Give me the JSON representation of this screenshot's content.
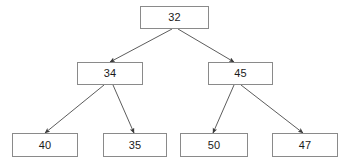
{
  "diagram": {
    "type": "binary-tree",
    "background_color": "#ffffff",
    "node_fill_color": "#ffffff",
    "node_border_color": "#8a8a8a",
    "edge_color": "#4a4a4a",
    "text_color": "#1a1a1a",
    "nodes": [
      {
        "id": "n32",
        "label": "32",
        "level": 0,
        "x": 140,
        "y": 6,
        "w": 69,
        "h": 23
      },
      {
        "id": "n34",
        "label": "34",
        "level": 1,
        "x": 77,
        "y": 62,
        "w": 66,
        "h": 23
      },
      {
        "id": "n45",
        "label": "45",
        "level": 1,
        "x": 208,
        "y": 62,
        "w": 65,
        "h": 23
      },
      {
        "id": "n40",
        "label": "40",
        "level": 2,
        "x": 12,
        "y": 133,
        "w": 66,
        "h": 24
      },
      {
        "id": "n35",
        "label": "35",
        "level": 2,
        "x": 103,
        "y": 133,
        "w": 64,
        "h": 24
      },
      {
        "id": "n50",
        "label": "50",
        "level": 2,
        "x": 180,
        "y": 133,
        "w": 68,
        "h": 24
      },
      {
        "id": "n47",
        "label": "47",
        "level": 2,
        "x": 272,
        "y": 133,
        "w": 66,
        "h": 24
      }
    ],
    "edges": [
      {
        "id": "e-32-34",
        "from": "n32",
        "to": "n34",
        "x1": 172,
        "y1": 29,
        "x2": 110,
        "y2": 62,
        "arrow": true
      },
      {
        "id": "e-32-45",
        "from": "n32",
        "to": "n45",
        "x1": 178,
        "y1": 29,
        "x2": 234,
        "y2": 62,
        "arrow": true
      },
      {
        "id": "e-34-40",
        "from": "n34",
        "to": "n40",
        "x1": 104,
        "y1": 85,
        "x2": 45,
        "y2": 133,
        "arrow": true
      },
      {
        "id": "e-34-35",
        "from": "n34",
        "to": "n35",
        "x1": 113,
        "y1": 85,
        "x2": 134,
        "y2": 133,
        "arrow": true
      },
      {
        "id": "e-45-50",
        "from": "n45",
        "to": "n50",
        "x1": 234,
        "y1": 85,
        "x2": 213,
        "y2": 133,
        "arrow": true
      },
      {
        "id": "e-45-47",
        "from": "n45",
        "to": "n47",
        "x1": 241,
        "y1": 85,
        "x2": 303,
        "y2": 133,
        "arrow": true
      }
    ]
  }
}
